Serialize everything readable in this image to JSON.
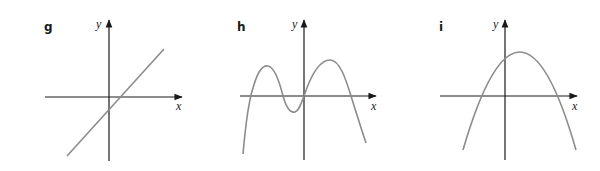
{
  "colors": {
    "axis": "#1a1a1a",
    "curve": "#8c8c8c",
    "background": "#ffffff"
  },
  "panels": [
    {
      "label": "g",
      "x_axis_label": "x",
      "y_axis_label": "y",
      "curve_type": "line"
    },
    {
      "label": "h",
      "x_axis_label": "x",
      "y_axis_label": "y",
      "curve_type": "quartic"
    },
    {
      "label": "i",
      "x_axis_label": "x",
      "y_axis_label": "y",
      "curve_type": "parabola"
    }
  ]
}
